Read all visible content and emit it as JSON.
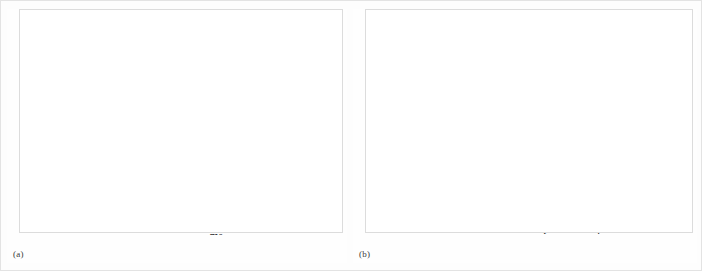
{
  "figure": {
    "panels": [
      {
        "tag": "(a)"
      },
      {
        "tag": "(b)"
      }
    ]
  },
  "chart_data": [
    {
      "panel": "(a)",
      "type": "line",
      "title": "",
      "xlabel": "ms",
      "xlim": [
        -12,
        155
      ],
      "xticks": [
        0,
        50,
        100,
        150
      ],
      "xticklabels": [
        "0",
        "50",
        "100",
        "150"
      ],
      "stimulus": {
        "label": "bundle displacement",
        "ylabel": "µm",
        "ylim": [
          0,
          0.5
        ],
        "yticks": [
          0,
          0.5
        ],
        "yticklabels": [
          "0",
          "0.5"
        ],
        "step_x": [
          -12,
          0,
          0,
          100,
          100,
          155
        ],
        "step_y": [
          0,
          0,
          0.5,
          0.5,
          0,
          0
        ]
      },
      "response": {
        "ylabel": "percentage of\nchannels open",
        "ylim": [
          10,
          80
        ],
        "yticks": [
          10,
          80
        ],
        "yticklabels": [
          "10",
          "80"
        ],
        "annotation": "adaptation",
        "baseline_x": [
          -9,
          0
        ],
        "baseline_y": [
          10,
          10
        ],
        "peak": {
          "x": 0,
          "y": 80
        },
        "decay_plateau": 21,
        "decay_tau": 22,
        "decay_end_x": 100,
        "offset_y": 10.2,
        "tail_end_y": 10.6,
        "markers": [
          {
            "kind": "open",
            "x": -6,
            "y": 13,
            "name": "resting-open-probability-marker"
          },
          {
            "kind": "filled",
            "x": 97,
            "y": 25.5,
            "name": "adapted-open-probability-marker"
          }
        ]
      }
    },
    {
      "panel": "(b)",
      "type": "scatter",
      "title": "",
      "xlabel": "bundle displacement / µm",
      "ylabel": "percentage of\nchannels open",
      "xlim": [
        -0.62,
        1.6
      ],
      "ylim": [
        -6,
        104
      ],
      "xticks": [
        -0.5,
        0,
        0.5,
        1.0,
        1.5
      ],
      "xticklabels": [
        "−0.5",
        "0",
        "0.5",
        "1.0",
        "1.5"
      ],
      "yticks": [
        0,
        50,
        100
      ],
      "yticklabels": [
        "0",
        "",
        "100"
      ],
      "annotation": {
        "line1": "0.5 µm",
        "line2": "adapting step"
      },
      "series": [
        {
          "name": "unadapted",
          "marker": "open",
          "x": [
            -0.33,
            -0.18,
            -0.1,
            -0.04,
            0.02,
            0.1,
            0.17,
            0.23,
            0.3,
            0.4,
            0.5,
            0.62,
            0.76,
            0.98,
            1.03
          ],
          "y": [
            0,
            0,
            1,
            2,
            5,
            21,
            42,
            57,
            68,
            81,
            89,
            94,
            97,
            98,
            98
          ],
          "fit": {
            "x0": 0.175,
            "slope": 0.145,
            "ymax": 100
          }
        },
        {
          "name": "adapted",
          "marker": "filled",
          "x": [
            -0.25,
            0.0,
            0.13,
            0.3,
            0.4,
            0.48,
            0.57,
            0.66,
            0.73,
            0.85,
            0.95,
            1.23,
            1.5
          ],
          "y": [
            0,
            0,
            0,
            4,
            9,
            30,
            50,
            72,
            86,
            80,
            96,
            99,
            100
          ],
          "fit": {
            "x0": 0.565,
            "slope": 0.115,
            "ymax": 100
          }
        }
      ]
    }
  ]
}
